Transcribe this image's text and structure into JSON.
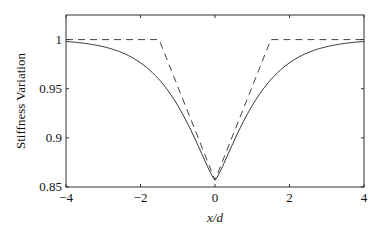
{
  "chart_data": {
    "type": "line",
    "title": "",
    "xlabel": "x/d",
    "ylabel": "Stiffness Variation",
    "xlim": [
      -4,
      4
    ],
    "ylim": [
      0.85,
      1.025
    ],
    "xticks": [
      -4,
      -2,
      0,
      2,
      4
    ],
    "xtick_labels": [
      "−4",
      "−2",
      "0",
      "2",
      "4"
    ],
    "yticks": [
      0.85,
      0.9,
      0.95,
      1
    ],
    "ytick_labels": [
      "0.85",
      "0.9",
      "0.95",
      "1"
    ],
    "grid": false,
    "legend": null,
    "series": [
      {
        "name": "smooth",
        "style": "solid",
        "color": "#333333",
        "x": [
          -4,
          -3.5,
          -3,
          -2.5,
          -2,
          -1.5,
          -1.25,
          -1,
          -0.75,
          -0.5,
          -0.25,
          0,
          0.25,
          0.5,
          0.75,
          1,
          1.25,
          1.5,
          2,
          2.5,
          3,
          3.5,
          4
        ],
        "y": [
          0.9995,
          0.999,
          0.997,
          0.993,
          0.985,
          0.97,
          0.958,
          0.942,
          0.922,
          0.9,
          0.877,
          0.857,
          0.877,
          0.9,
          0.922,
          0.942,
          0.958,
          0.97,
          0.985,
          0.993,
          0.997,
          0.999,
          0.9995
        ]
      },
      {
        "name": "piecewise-linear",
        "style": "dashed",
        "color": "#444444",
        "x": [
          -4,
          -1.5,
          0,
          1.5,
          4
        ],
        "y": [
          1,
          1,
          0.857,
          1,
          1
        ]
      }
    ]
  }
}
